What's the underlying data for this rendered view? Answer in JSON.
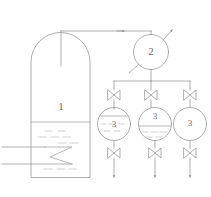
{
  "diagram": {
    "caption": "",
    "stroke_color": "#8c8c8c",
    "light_stroke_color": "#b8b8b8",
    "label_color": "#6b6b6b",
    "background_color": "#ffffff"
  },
  "equipment": {
    "storage_tank": {
      "label": "1",
      "name": "storage-tank",
      "liquid_level_percent": 52,
      "has_dome_top": true,
      "internal_coil": "zigzag"
    },
    "separator": {
      "label": "2",
      "name": "separator-vessel",
      "inlet_direction": "lower-left",
      "outlet_direction": "upper-right"
    },
    "receivers": [
      {
        "label": "3",
        "name": "receiver-vessel-left",
        "liquid_level_percent": 70
      },
      {
        "label": "3",
        "name": "receiver-vessel-middle",
        "liquid_level_percent": 48
      },
      {
        "label": "3",
        "name": "receiver-vessel-right",
        "liquid_level_percent": 0
      }
    ]
  },
  "valves": {
    "top": [
      {
        "name": "inlet-valve-left",
        "state": "closed"
      },
      {
        "name": "inlet-valve-middle",
        "state": "closed"
      },
      {
        "name": "inlet-valve-right",
        "state": "closed"
      }
    ],
    "bottom": [
      {
        "name": "outlet-valve-left",
        "state": "closed"
      },
      {
        "name": "outlet-valve-middle",
        "state": "closed"
      },
      {
        "name": "outlet-valve-right",
        "state": "closed"
      }
    ]
  },
  "flow_arrows": {
    "vapor_header": "right",
    "separator_outlet": "upper-right",
    "drain_left": "down",
    "drain_middle": "down",
    "drain_right": "down"
  },
  "feed_lines": [
    {
      "name": "feed-line-upper"
    },
    {
      "name": "feed-line-lower"
    }
  ]
}
